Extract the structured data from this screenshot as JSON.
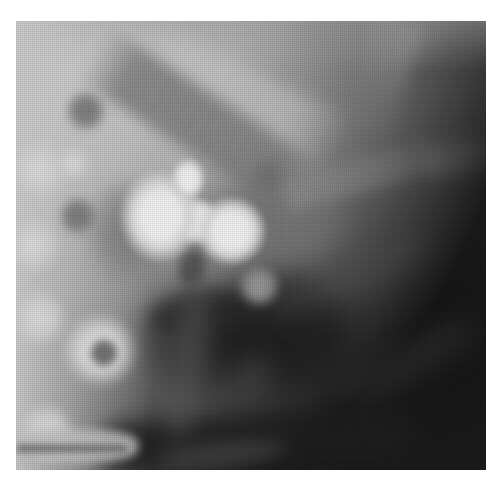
{
  "figure": {
    "type": "radiograph"
  },
  "palette": {
    "page_background": "#ffffff",
    "film_base": "#565656",
    "dark_field": "#181818",
    "midtone_band": "#888888",
    "bright_tissue": "#d6d6d6",
    "barium_highlight": "#f3f3f3"
  }
}
